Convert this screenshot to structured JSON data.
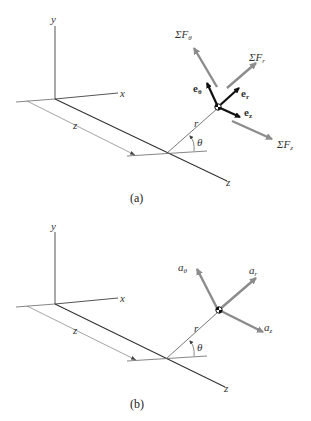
{
  "figure_a": {
    "caption": "(a)",
    "axes": {
      "y": "y",
      "x": "x",
      "z_axis": "z",
      "z_dim": "z"
    },
    "r_label": "r",
    "theta_label": "θ",
    "unit_vectors": {
      "e_theta": {
        "base": "e",
        "sub": "θ"
      },
      "e_r": {
        "base": "e",
        "sub": "r"
      },
      "e_z": {
        "base": "e",
        "sub": "z"
      }
    },
    "forces": {
      "F_theta": {
        "base": "ΣF",
        "sub": "θ"
      },
      "F_r": {
        "base": "ΣF",
        "sub": "r"
      },
      "F_z": {
        "base": "ΣF",
        "sub": "z"
      }
    }
  },
  "figure_b": {
    "caption": "(b)",
    "axes": {
      "y": "y",
      "x": "x",
      "z_axis": "z",
      "z_dim": "z"
    },
    "r_label": "r",
    "theta_label": "θ",
    "accelerations": {
      "a_theta": {
        "base": "a",
        "sub": "θ"
      },
      "a_r": {
        "base": "a",
        "sub": "r"
      },
      "a_z": {
        "base": "a",
        "sub": "z"
      }
    }
  },
  "colors": {
    "axis": "#444444",
    "force_arrow": "#8c8c8c",
    "unit_vector": "#111111"
  }
}
